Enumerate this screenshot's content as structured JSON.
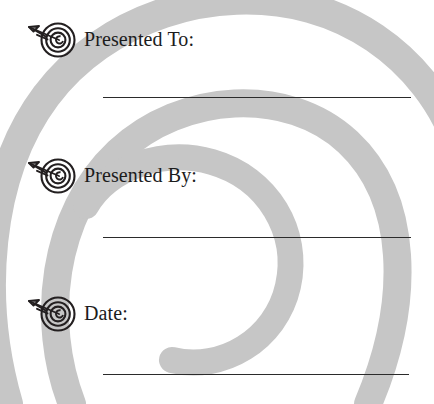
{
  "document": {
    "type": "certificate-fill-in-fields",
    "background_shape": "spiral",
    "colors": {
      "spiral_gray": "#c6c6c6",
      "text": "#1c1c1c",
      "rule_line": "#2b2b2b",
      "page_background": "#ffffff"
    }
  },
  "fields": [
    {
      "id": "presented-to",
      "label": "Presented To:",
      "icon": "target-arrow-icon",
      "value": "",
      "placeholder": ""
    },
    {
      "id": "presented-by",
      "label": "Presented By:",
      "icon": "target-arrow-icon",
      "value": "",
      "placeholder": ""
    },
    {
      "id": "date",
      "label": "Date:",
      "icon": "target-arrow-icon",
      "value": "",
      "placeholder": ""
    }
  ]
}
